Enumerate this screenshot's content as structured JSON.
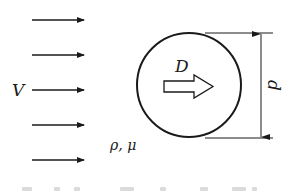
{
  "diagram": {
    "type": "fluid-drag-on-sphere",
    "colors": {
      "ink": "#1a1a1a",
      "background": "#ffffff"
    },
    "flow": {
      "label": "V",
      "arrow_count": 5,
      "arrow_y": [
        20,
        55,
        90,
        125,
        160
      ],
      "arrow_x_start": 32,
      "arrow_x_end": 84
    },
    "fluid_properties": {
      "label": "ρ, μ"
    },
    "sphere": {
      "center_x": 189,
      "center_y": 85,
      "radius": 52
    },
    "drag_force": {
      "label": "D"
    },
    "dimension": {
      "label": "d",
      "x": 261,
      "y_top": 33,
      "y_bottom": 138
    },
    "caption": {
      "visible": "partially cut off, unreadable"
    }
  }
}
